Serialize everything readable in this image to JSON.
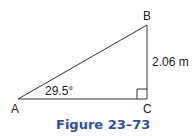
{
  "figure": {
    "caption": "Figure 23–73",
    "caption_color": "#2a4fb0",
    "line_color": "#333333"
  },
  "triangle": {
    "vertices": {
      "A": {
        "label": "A"
      },
      "B": {
        "label": "B"
      },
      "C": {
        "label": "C"
      }
    },
    "angle_A_label": "29.5°",
    "side_BC_label": "2.06 m",
    "right_angle_at": "C"
  }
}
